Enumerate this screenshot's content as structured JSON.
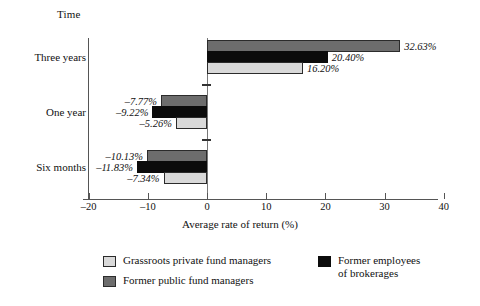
{
  "chart_data": {
    "type": "bar",
    "orientation": "horizontal",
    "title": "",
    "category_axis_label": "Time",
    "xlabel": "Average rate of return (%)",
    "ylabel": "",
    "xlim": [
      -20,
      40
    ],
    "xticks": [
      -20,
      -10,
      0,
      10,
      20,
      30,
      40
    ],
    "xticklabels": [
      "–20",
      "–10",
      "0",
      "10",
      "20",
      "30",
      "40"
    ],
    "grid": false,
    "legend_position": "bottom",
    "categories": [
      "Three years",
      "One year",
      "Six months"
    ],
    "series": [
      {
        "name": "Grassroots private fund managers",
        "color": "#d9d9d9",
        "values": [
          16.2,
          -5.26,
          -7.34
        ],
        "labels": [
          "16.20%",
          "–5.26%",
          "–7.34%"
        ]
      },
      {
        "name": "Former employees of brokerages",
        "color": "#0c0c0c",
        "values": [
          20.4,
          -9.22,
          -11.83
        ],
        "labels": [
          "20.40%",
          "–9.22%",
          "–11.83%"
        ]
      },
      {
        "name": "Former public fund managers",
        "color": "#6d6d6d",
        "values": [
          32.63,
          -7.77,
          -10.13
        ],
        "labels": [
          "32.63%",
          "–7.77%",
          "–10.13%"
        ]
      }
    ]
  },
  "legend": {
    "entries": [
      {
        "label": "Grassroots private fund managers",
        "swatch": "s-light"
      },
      {
        "label": "Former public fund managers",
        "swatch": "s-dark"
      },
      {
        "label": "Former employees\nof brokerages",
        "swatch": "s-black"
      }
    ]
  }
}
